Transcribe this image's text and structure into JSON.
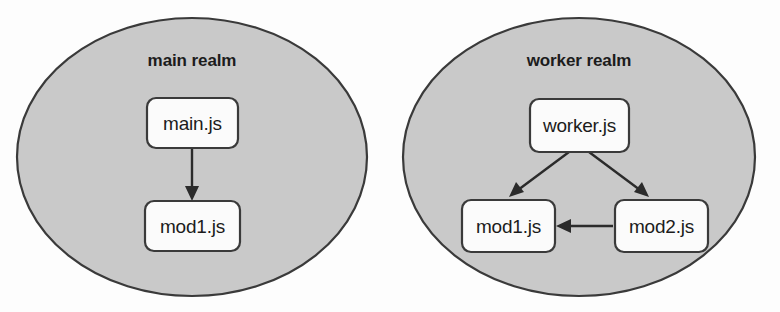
{
  "diagram": {
    "colors": {
      "realm_fill": "#c9c9c9",
      "realm_stroke": "#3a3a3a",
      "node_fill": "#fbfbfb",
      "node_stroke": "#3a3a3a",
      "edge": "#2b2b2b",
      "text": "#1c1c1c",
      "background": "#fdfdfd"
    },
    "realms": [
      {
        "id": "main-realm",
        "label": "main realm",
        "nodes": [
          {
            "id": "main-js",
            "label": "main.js"
          },
          {
            "id": "main-mod1-js",
            "label": "mod1.js"
          }
        ],
        "edges": [
          {
            "id": "main-js-to-mod1-js",
            "from": "main.js",
            "to": "mod1.js",
            "direction": "down"
          }
        ]
      },
      {
        "id": "worker-realm",
        "label": "worker realm",
        "nodes": [
          {
            "id": "worker-js",
            "label": "worker.js"
          },
          {
            "id": "worker-mod1-js",
            "label": "mod1.js"
          },
          {
            "id": "worker-mod2-js",
            "label": "mod2.js"
          }
        ],
        "edges": [
          {
            "id": "worker-js-to-mod1-js",
            "from": "worker.js",
            "to": "mod1.js",
            "direction": "down-left"
          },
          {
            "id": "worker-js-to-mod2-js",
            "from": "worker.js",
            "to": "mod2.js",
            "direction": "down-right"
          },
          {
            "id": "mod2-js-to-mod1-js",
            "from": "mod2.js",
            "to": "mod1.js",
            "direction": "left"
          }
        ]
      }
    ]
  }
}
